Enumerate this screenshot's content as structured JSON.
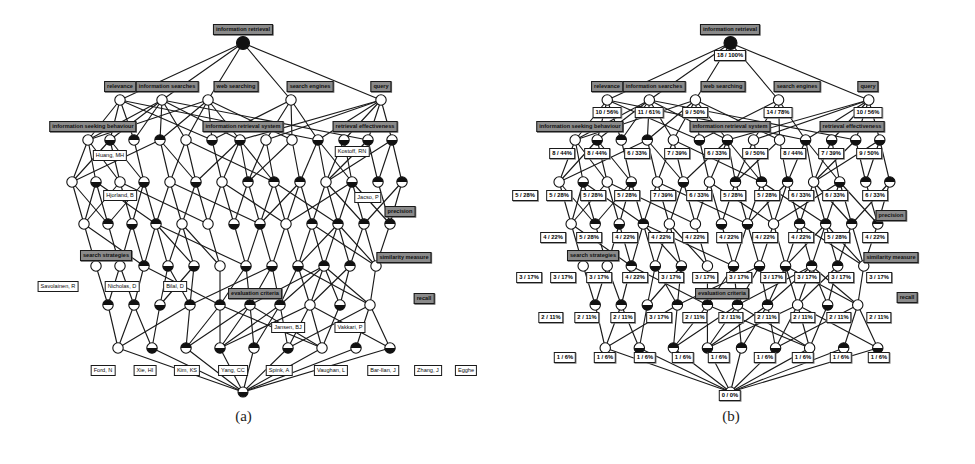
{
  "figure": {
    "caption_a": "(a)",
    "caption_b": "(b)",
    "type": "concept-lattice-hasse-diagram",
    "panel_a_title": "Concept lattice labelled with terms and authors",
    "panel_b_title": "Concept lattice labelled with extent size and support"
  },
  "colors": {
    "attribute_fill": "#8a8a8a",
    "object_fill": "#ffffff",
    "node_stroke": "#111111",
    "edge": "#1a1a1a",
    "background": "#ffffff"
  },
  "chart_data": {
    "type": "diagram",
    "panels": [
      {
        "id": "a",
        "caption": "(a)",
        "attribute_labels": [
          "information retrieval",
          "relevance",
          "information searches",
          "web searching",
          "search engines",
          "query",
          "information seeking behaviour",
          "information retrieval system",
          "retrieval effectiveness",
          "precision",
          "search strategies",
          "evaluation criteria",
          "similarity measure",
          "recall"
        ],
        "object_labels": [
          "Huang, MH",
          "Kostoff, RN",
          "Hjorland, B",
          "Jacso, P",
          "Savolainen, R",
          "Nicholas, D",
          "Bilal, D",
          "Jansen, BJ",
          "Vakkari, P",
          "Ford, N",
          "Xie, HI",
          "Kim, KS",
          "Yang, CC",
          "Spink, A",
          "Vaughan, L",
          "Bar-Ilan, J",
          "Zhang, J",
          "Egghe"
        ],
        "nodes": [
          {
            "id": "a-top",
            "x": 243,
            "y": 43,
            "r": 6.5,
            "fill": "half-top",
            "label": "information retrieval",
            "label_kind": "attr",
            "label_x": 243,
            "label_y": 18,
            "label_anchor": "center"
          },
          {
            "id": "a-r1-1",
            "x": 120,
            "y": 100,
            "r": 5.5,
            "fill": "half-top",
            "label": "relevance",
            "label_kind": "attr",
            "label_x": 120,
            "label_y": 76,
            "label_anchor": "center"
          },
          {
            "id": "a-r1-2",
            "x": 162,
            "y": 100,
            "r": 5.5,
            "fill": "half-top",
            "label": "information searches",
            "label_kind": "attr",
            "label_x": 162,
            "label_y": 76,
            "label_anchor": "center"
          },
          {
            "id": "a-r1-3",
            "x": 208,
            "y": 100,
            "r": 5.5,
            "fill": "half-top",
            "label": "web searching",
            "label_kind": "attr",
            "label_x": 235,
            "label_y": 76,
            "label_anchor": "center"
          },
          {
            "id": "a-r1-4",
            "x": 291,
            "y": 100,
            "r": 5.5,
            "fill": "half-top",
            "label": "search engines",
            "label_kind": "attr",
            "label_x": 308,
            "label_y": 76,
            "label_anchor": "center"
          },
          {
            "id": "a-r1-5",
            "x": 381,
            "y": 100,
            "r": 5.5,
            "fill": "half-top",
            "label": "query",
            "label_kind": "attr",
            "label_x": 381,
            "label_y": 76,
            "label_anchor": "center"
          }
        ],
        "row_labels_attr": [
          {
            "text": "information seeking behaviour",
            "x": 96,
            "y": 119
          },
          {
            "text": "information retrieval system",
            "x": 246,
            "y": 119
          },
          {
            "text": "retrieval effectiveness",
            "x": 362,
            "y": 119
          },
          {
            "text": "precision",
            "x": 402,
            "y": 205
          },
          {
            "text": "search strategies",
            "x": 104,
            "y": 249
          },
          {
            "text": "evaluation criteria",
            "x": 253,
            "y": 287
          },
          {
            "text": "similarity measure",
            "x": 404,
            "y": 250
          },
          {
            "text": "recall",
            "x": 422,
            "y": 292
          }
        ],
        "row_labels_obj": [
          {
            "text": "Huang, MH",
            "x": 104,
            "y": 150
          },
          {
            "text": "Kostoff, RN",
            "x": 352,
            "y": 146
          },
          {
            "text": "Hjorland, B",
            "x": 113,
            "y": 190
          },
          {
            "text": "Jacso, P",
            "x": 367,
            "y": 192
          },
          {
            "text": "Savolainen, R",
            "x": 56,
            "y": 280
          },
          {
            "text": "Nicholas, D",
            "x": 119,
            "y": 279
          },
          {
            "text": "Bilal, D",
            "x": 173,
            "y": 278
          },
          {
            "text": "Jansen, BJ",
            "x": 285,
            "y": 320
          },
          {
            "text": "Vakkari, P",
            "x": 345,
            "y": 320
          },
          {
            "text": "Ford, N",
            "x": 104,
            "y": 366
          },
          {
            "text": "Xie, HI",
            "x": 146,
            "y": 366
          },
          {
            "text": "Kim, KS",
            "x": 187,
            "y": 366
          },
          {
            "text": "Yang, CC",
            "x": 233,
            "y": 366
          },
          {
            "text": "Spink, A",
            "x": 279,
            "y": 366
          },
          {
            "text": "Vaughan, L",
            "x": 331,
            "y": 366
          },
          {
            "text": "Bar-Ilan, J",
            "x": 383,
            "y": 366
          },
          {
            "text": "Zhang, J",
            "x": 428,
            "y": 366
          },
          {
            "text": "Egghe",
            "x": 466,
            "y": 366
          }
        ]
      },
      {
        "id": "b",
        "caption": "(b)",
        "attribute_labels": [
          "information retrieval",
          "relevance",
          "information searches",
          "web searching",
          "search engines",
          "query",
          "information seeking behaviour",
          "information retrieval system",
          "retrieval effectiveness",
          "precision",
          "search strategies",
          "evaluation criteria",
          "similarity measure",
          "recall"
        ],
        "support_rows": [
          {
            "row": 0,
            "values": [
              "18 / 100%"
            ]
          },
          {
            "row": 1,
            "values": [
              "10 / 56%",
              "11 / 61%",
              "9 / 50%",
              "14 / 78%",
              "10 / 56%"
            ]
          },
          {
            "row": 2,
            "values": [
              "8 / 44%",
              "8 / 44%",
              "6 / 33%",
              "7 / 39%",
              "6 / 33%",
              "9 / 50%",
              "8 / 44%",
              "7 / 39%",
              "9 / 50%"
            ]
          },
          {
            "row": 3,
            "values": [
              "5 / 28%",
              "5 / 28%",
              "5 / 28%",
              "5 / 28%",
              "7 / 39%",
              "6 / 33%",
              "5 / 28%",
              "5 / 28%",
              "6 / 33%",
              "6 / 33%",
              "6 / 33%"
            ]
          },
          {
            "row": 4,
            "values": [
              "4 / 22%",
              "5 / 28%",
              "4 / 22%",
              "4 / 22%",
              "4 / 22%",
              "4 / 22%",
              "4 / 22%",
              "4 / 22%",
              "5 / 28%",
              "4 / 22%"
            ]
          },
          {
            "row": 5,
            "values": [
              "3 / 17%",
              "3 / 17%",
              "3 / 17%",
              "4 / 22%",
              "3 / 17%",
              "3 / 17%",
              "3 / 17%",
              "3 / 17%",
              "3 / 17%",
              "3 / 17%",
              "3 / 17%"
            ]
          },
          {
            "row": 6,
            "values": [
              "2 / 11%",
              "2 / 11%",
              "2 / 11%",
              "3 / 17%",
              "2 / 11%",
              "2 / 11%",
              "2 / 11%",
              "2 / 11%",
              "2 / 11%",
              "2 / 11%"
            ]
          },
          {
            "row": 7,
            "values": [
              "1 / 6%",
              "1 / 6%",
              "1 / 6%",
              "1 / 6%",
              "1 / 6%",
              "1 / 6%",
              "1 / 6%",
              "1 / 6%",
              "1 / 6%"
            ]
          },
          {
            "row": 8,
            "values": [
              "0 / 0%"
            ]
          }
        ],
        "total_objects": 18
      }
    ]
  },
  "panel_a": {
    "attrs": {
      "top": "information retrieval",
      "relevance": "relevance",
      "info_searches": "information searches",
      "web_searching": "web searching",
      "search_engines": "search engines",
      "query": "query",
      "isb": "information seeking behaviour",
      "irs": "information retrieval system",
      "re": "retrieval effectiveness",
      "precision": "precision",
      "search_strategies": "search strategies",
      "eval_criteria": "evaluation criteria",
      "similarity": "similarity measure",
      "recall": "recall"
    },
    "objs": {
      "huang": "Huang, MH",
      "kostoff": "Kostoff, RN",
      "hjorland": "Hjorland, B",
      "jacso": "Jacso, P",
      "savolainen": "Savolainen, R",
      "nicholas": "Nicholas, D",
      "bilal": "Bilal, D",
      "jansen": "Jansen, BJ",
      "vakkari": "Vakkari, P",
      "ford": "Ford, N",
      "xie": "Xie, HI",
      "kim": "Kim, KS",
      "yang": "Yang, CC",
      "spink": "Spink, A",
      "vaughan": "Vaughan, L",
      "barilan": "Bar-Ilan, J",
      "zhang": "Zhang, J",
      "egghe": "Egghe"
    }
  },
  "panel_b": {
    "attrs": {
      "top": "information retrieval",
      "relevance": "relevance",
      "info_searches": "information searches",
      "web_searching": "web searching",
      "search_engines": "search engines",
      "query": "query",
      "isb": "information seeking behaviour",
      "irs": "information retrieval system",
      "re": "retrieval effectiveness",
      "precision": "precision",
      "search_strategies": "search strategies",
      "eval_criteria": "evaluation criteria",
      "similarity": "similarity measure",
      "recall": "recall"
    },
    "counts": {
      "top": "18 / 100%",
      "bottom": "0 / 0%",
      "r1": [
        "10 / 56%",
        "11 / 61%",
        "9 / 50%",
        "14 / 78%",
        "10 / 56%"
      ],
      "r2": [
        "8 / 44%",
        "8 / 44%",
        "6 / 33%",
        "7 / 39%",
        "6 / 33%",
        "9 / 50%",
        "8 / 44%",
        "7 / 39%",
        "9 / 50%"
      ],
      "r3": [
        "5 / 28%",
        "5 / 28%",
        "5 / 28%",
        "5 / 28%",
        "7 / 39%",
        "6 / 33%",
        "5 / 28%",
        "5 / 28%",
        "6 / 33%",
        "6 / 33%",
        "6 / 33%"
      ],
      "r4": [
        "4 / 22%",
        "5 / 28%",
        "4 / 22%",
        "4 / 22%",
        "4 / 22%",
        "4 / 22%",
        "4 / 22%",
        "4 / 22%",
        "5 / 28%",
        "4 / 22%"
      ],
      "r5": [
        "3 / 17%",
        "3 / 17%",
        "3 / 17%",
        "4 / 22%",
        "3 / 17%",
        "3 / 17%",
        "3 / 17%",
        "3 / 17%",
        "3 / 17%",
        "3 / 17%",
        "3 / 17%"
      ],
      "r6": [
        "2 / 11%",
        "2 / 11%",
        "2 / 11%",
        "3 / 17%",
        "2 / 11%",
        "2 / 11%",
        "2 / 11%",
        "2 / 11%",
        "2 / 11%",
        "2 / 11%"
      ],
      "r7": [
        "1 / 6%",
        "1 / 6%",
        "1 / 6%",
        "1 / 6%",
        "1 / 6%",
        "1 / 6%",
        "1 / 6%",
        "1 / 6%",
        "1 / 6%"
      ]
    }
  }
}
